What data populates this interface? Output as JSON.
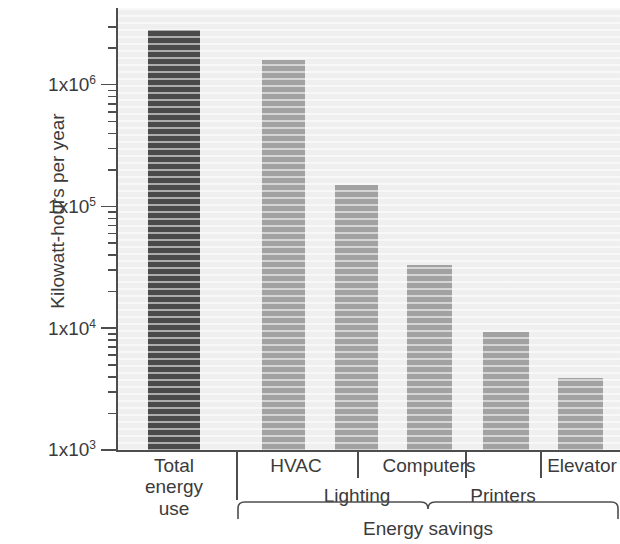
{
  "chart_data": {
    "type": "bar",
    "title": "",
    "xlabel": "",
    "ylabel": "Kilowatt-hours per year",
    "yscale": "log",
    "ylim": [
      1000,
      4000000
    ],
    "grid": false,
    "legend": null,
    "categories": [
      "Total energy use",
      "HVAC",
      "Lighting",
      "Computers",
      "Printers",
      "Elevator"
    ],
    "values": [
      2800000,
      1600000,
      150000,
      33000,
      9300,
      3900
    ],
    "bar_colors": [
      "#4a4a4a",
      "#a2a2a2",
      "#a2a2a2",
      "#a2a2a2",
      "#a2a2a2",
      "#a2a2a2"
    ],
    "ytick_values": [
      1000,
      10000,
      100000,
      1000000
    ],
    "ytick_labels": [
      "1x10",
      "1x10",
      "1x10",
      "1x10"
    ],
    "ytick_exponents": [
      "3",
      "4",
      "5",
      "6"
    ],
    "group_bracket": {
      "label": "Energy savings",
      "covers": [
        "HVAC",
        "Lighting",
        "Computers",
        "Printers",
        "Elevator"
      ]
    }
  },
  "axis": {
    "y_title": "Kilowatt-hours per year",
    "ticks": [
      {
        "mantissa": "1x10",
        "exponent": "6"
      },
      {
        "mantissa": "1x10",
        "exponent": "5"
      },
      {
        "mantissa": "1x10",
        "exponent": "4"
      },
      {
        "mantissa": "1x10",
        "exponent": "3"
      }
    ]
  },
  "x_categories": [
    {
      "id": "total-energy-use",
      "lines": "Total\nenergy\nuse",
      "row": "stacked"
    },
    {
      "id": "hvac",
      "lines": "HVAC",
      "row": "upper"
    },
    {
      "id": "lighting",
      "lines": "Lighting",
      "row": "lower"
    },
    {
      "id": "computers",
      "lines": "Computers",
      "row": "upper"
    },
    {
      "id": "printers",
      "lines": "Printers",
      "row": "lower"
    },
    {
      "id": "elevator",
      "lines": "Elevator",
      "row": "upper"
    }
  ],
  "group": {
    "label": "Energy savings"
  },
  "colors": {
    "bar_dark": "#4a4a4a",
    "bar_light": "#a2a2a2",
    "plot_background": "#efefef",
    "axis": "#4d4d4d",
    "text": "#3b3b3b"
  }
}
